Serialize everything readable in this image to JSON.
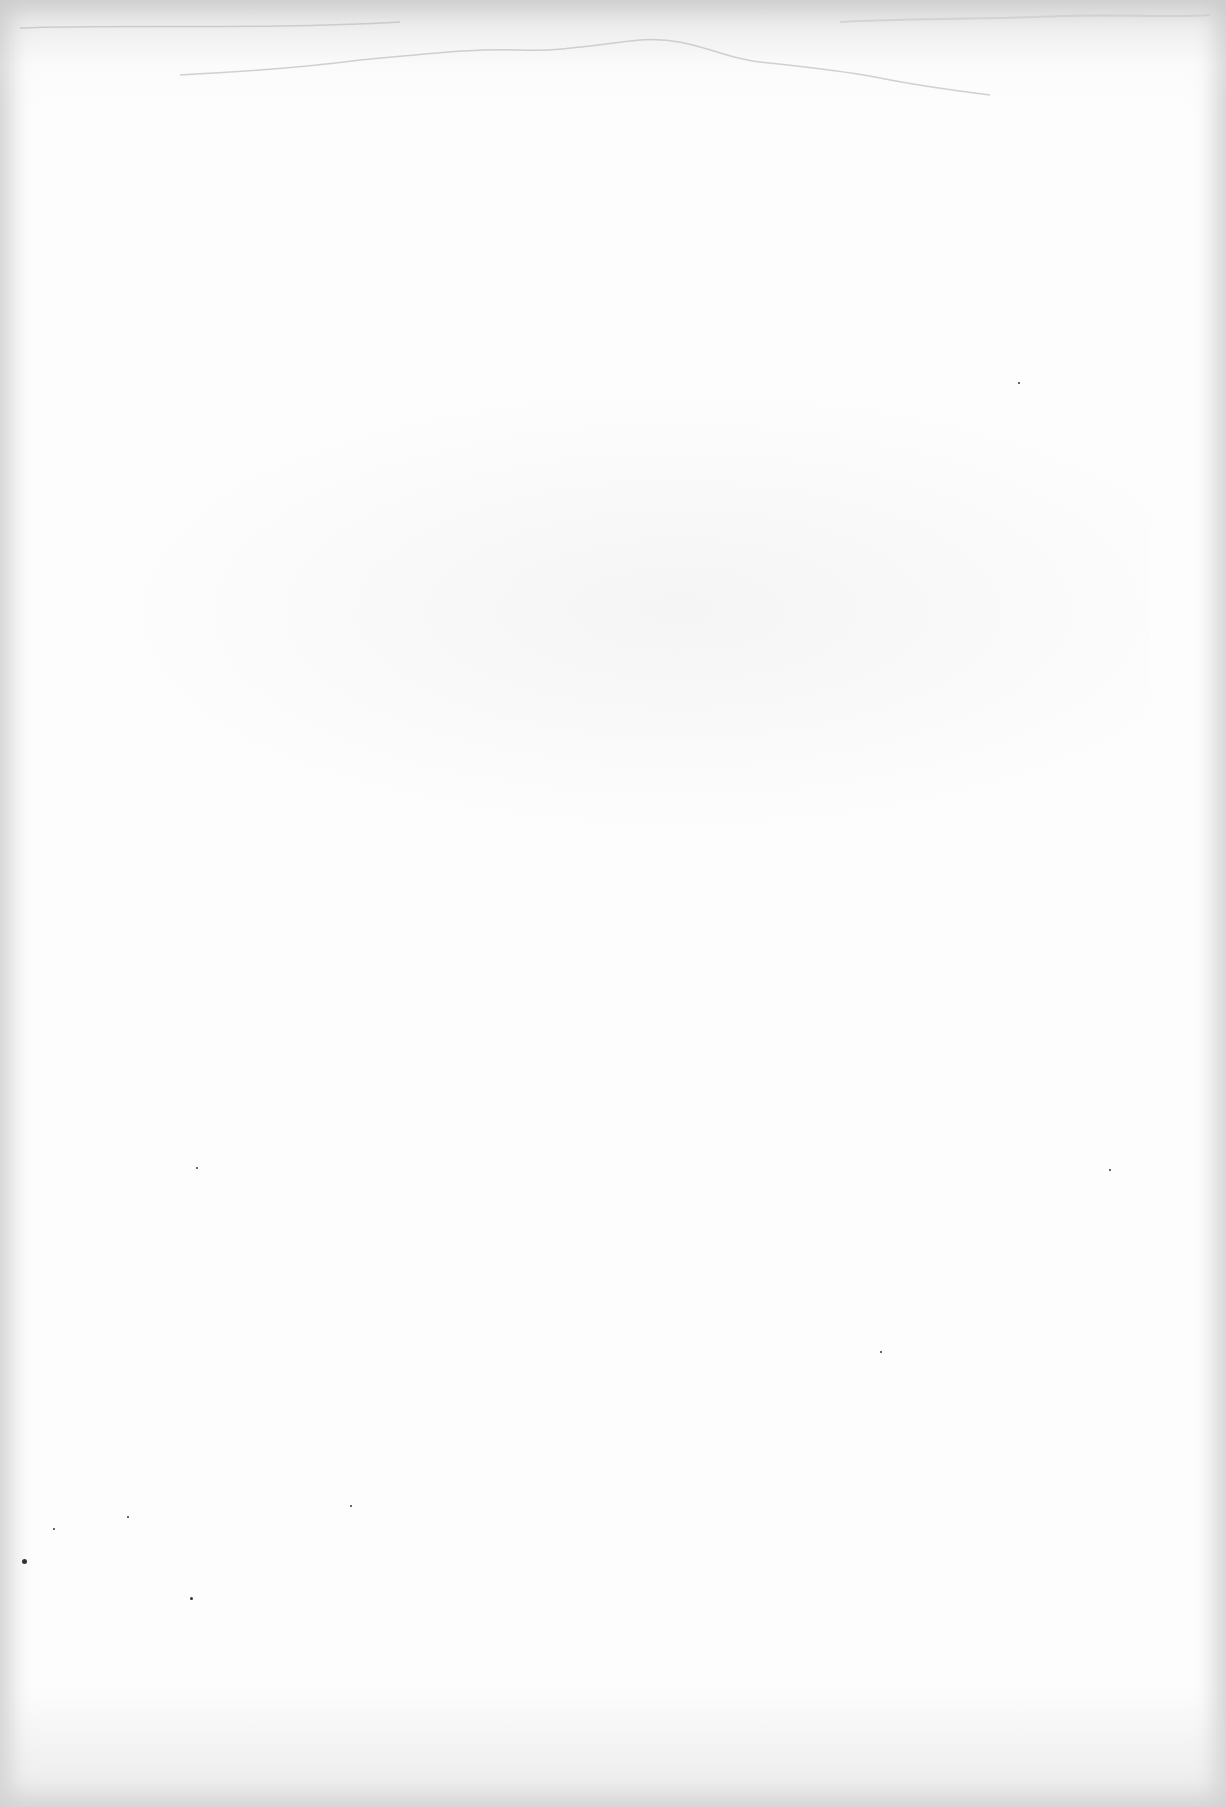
{
  "document": {
    "type": "scanned-page",
    "content": "",
    "has_text": false
  },
  "colors": {
    "paper": "#fdfdfd",
    "edge_shadow": "#aaaaaa",
    "stain": "#bdbdbd",
    "speck": "#333333"
  },
  "specks": [
    {
      "x": 22,
      "y": 1559,
      "size": 5
    },
    {
      "x": 190,
      "y": 1597,
      "size": 3
    },
    {
      "x": 53,
      "y": 1528,
      "size": 2
    },
    {
      "x": 127,
      "y": 1516,
      "size": 2
    },
    {
      "x": 350,
      "y": 1505,
      "size": 2
    },
    {
      "x": 196,
      "y": 1167,
      "size": 2
    },
    {
      "x": 1109,
      "y": 1169,
      "size": 2
    },
    {
      "x": 1018,
      "y": 382,
      "size": 2
    },
    {
      "x": 880,
      "y": 1351,
      "size": 2
    }
  ]
}
